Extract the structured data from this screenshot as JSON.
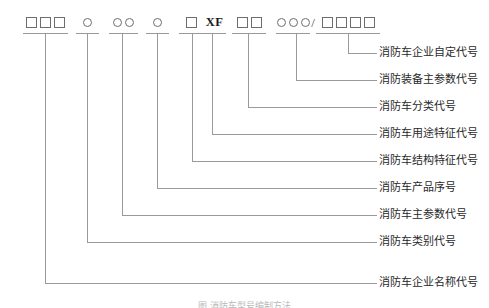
{
  "diagram": {
    "title_caption": "图  消防车型号编制方法",
    "line_color": "#9a9a9a",
    "text_color": "#2a2a2a",
    "segments": [
      {
        "id": "seg-enterprise-name",
        "symbol_kind": "boxes",
        "symbol_count": 3,
        "symbol_text": "□□□",
        "label": "消防车企业名称代号"
      },
      {
        "id": "seg-vehicle-category",
        "symbol_kind": "circles",
        "symbol_count": 1,
        "symbol_text": "○",
        "label": "消防车类别代号"
      },
      {
        "id": "seg-main-parameter",
        "symbol_kind": "circles",
        "symbol_count": 2,
        "symbol_text": "○○",
        "label": "消防车主参数代号"
      },
      {
        "id": "seg-product-serial",
        "symbol_kind": "circles",
        "symbol_count": 1,
        "symbol_text": "○",
        "label": "消防车产品序号"
      },
      {
        "id": "seg-structure-feature",
        "symbol_kind": "boxes",
        "symbol_count": 1,
        "symbol_text": "□",
        "label": "消防车结构特征代号"
      },
      {
        "id": "seg-usage-feature",
        "symbol_kind": "literal",
        "symbol_count": 0,
        "symbol_text": "XF",
        "label": "消防车用途特征代号"
      },
      {
        "id": "seg-classification",
        "symbol_kind": "boxes",
        "symbol_count": 2,
        "symbol_text": "□□",
        "label": "消防车分类代号"
      },
      {
        "id": "seg-equipment-main-parameter",
        "symbol_kind": "circles",
        "symbol_count": 3,
        "symbol_text": "○○○",
        "label": "消防装备主参数代号"
      },
      {
        "id": "seg-enterprise-custom",
        "symbol_kind": "boxes",
        "symbol_count": 4,
        "symbol_text": "□□□□",
        "label": "消防车企业自定代号"
      }
    ],
    "separator": "/"
  }
}
